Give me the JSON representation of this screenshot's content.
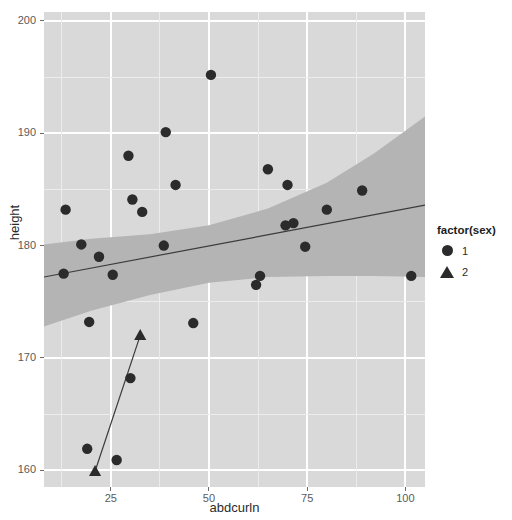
{
  "chart_data": {
    "type": "scatter",
    "title": "",
    "xlabel": "abdcurln",
    "ylabel": "height",
    "xlim": [
      8,
      105
    ],
    "ylim": [
      158.5,
      200.8
    ],
    "xticks": [
      25,
      50,
      75,
      100
    ],
    "yticks": [
      200,
      190,
      180,
      170,
      160
    ],
    "grid": true,
    "legend": {
      "title": "factor(sex)",
      "position": "right",
      "entries": [
        {
          "label": "1",
          "marker": "circle"
        },
        {
          "label": "2",
          "marker": "triangle"
        }
      ]
    },
    "series": [
      {
        "name": "1",
        "marker": "circle",
        "points": [
          {
            "x": 50.5,
            "y": 195.2
          },
          {
            "x": 39.0,
            "y": 190.1
          },
          {
            "x": 29.5,
            "y": 188.0
          },
          {
            "x": 41.5,
            "y": 185.4
          },
          {
            "x": 30.5,
            "y": 184.1
          },
          {
            "x": 33.0,
            "y": 183.0
          },
          {
            "x": 13.5,
            "y": 183.2
          },
          {
            "x": 65.0,
            "y": 186.8
          },
          {
            "x": 70.0,
            "y": 185.4
          },
          {
            "x": 89.0,
            "y": 184.9
          },
          {
            "x": 80.0,
            "y": 183.2
          },
          {
            "x": 69.5,
            "y": 181.8
          },
          {
            "x": 71.5,
            "y": 182.0
          },
          {
            "x": 17.5,
            "y": 180.1
          },
          {
            "x": 38.5,
            "y": 180.0
          },
          {
            "x": 74.5,
            "y": 179.9
          },
          {
            "x": 22.0,
            "y": 179.0
          },
          {
            "x": 13.0,
            "y": 177.5
          },
          {
            "x": 25.5,
            "y": 177.4
          },
          {
            "x": 63.0,
            "y": 177.3
          },
          {
            "x": 101.5,
            "y": 177.3
          },
          {
            "x": 62.0,
            "y": 176.5
          },
          {
            "x": 19.5,
            "y": 173.2
          },
          {
            "x": 46.0,
            "y": 173.1
          },
          {
            "x": 30.0,
            "y": 168.2
          },
          {
            "x": 19.0,
            "y": 161.9
          },
          {
            "x": 26.5,
            "y": 160.9
          }
        ]
      },
      {
        "name": "2",
        "marker": "triangle",
        "points": [
          {
            "x": 32.5,
            "y": 172.0
          },
          {
            "x": 21.0,
            "y": 159.9
          }
        ]
      }
    ],
    "fits": [
      {
        "group": "1",
        "line": [
          {
            "x": 8,
            "y": 177.2
          },
          {
            "x": 105,
            "y": 183.6
          }
        ],
        "ribbon_upper": [
          {
            "x": 8,
            "y": 180.1
          },
          {
            "x": 20,
            "y": 180.6
          },
          {
            "x": 35,
            "y": 181.0
          },
          {
            "x": 50,
            "y": 181.8
          },
          {
            "x": 65,
            "y": 183.3
          },
          {
            "x": 80,
            "y": 185.6
          },
          {
            "x": 92,
            "y": 188.2
          },
          {
            "x": 105,
            "y": 191.5
          }
        ],
        "ribbon_lower": [
          {
            "x": 8,
            "y": 172.8
          },
          {
            "x": 20,
            "y": 174.2
          },
          {
            "x": 35,
            "y": 175.6
          },
          {
            "x": 50,
            "y": 176.7
          },
          {
            "x": 65,
            "y": 177.2
          },
          {
            "x": 80,
            "y": 177.3
          },
          {
            "x": 92,
            "y": 177.3
          },
          {
            "x": 105,
            "y": 177.2
          }
        ]
      },
      {
        "group": "2",
        "line": [
          {
            "x": 21.0,
            "y": 159.9
          },
          {
            "x": 32.5,
            "y": 172.0
          }
        ]
      }
    ],
    "colors": {
      "panel_background": "#d9d9d9",
      "grid_major": "#ffffff",
      "grid_minor": "#ececec",
      "point": "#2b2b2b",
      "fit_line": "#3b3b3b",
      "ribbon": "#b4b4b4",
      "axis_text": "#5a5a5a",
      "axis_title": "#2b2b2b",
      "plot_background": "#ffffff"
    }
  }
}
